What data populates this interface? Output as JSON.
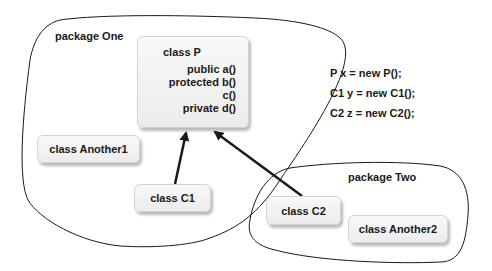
{
  "diagram": {
    "packages": [
      {
        "id": "one",
        "label": "package One"
      },
      {
        "id": "two",
        "label": "package Two"
      }
    ],
    "classes": {
      "P": {
        "title": "class P",
        "methods": [
          "public a()",
          "protected b()",
          "c()",
          "private d()"
        ]
      },
      "Another1": {
        "title": "class Another1"
      },
      "C1": {
        "title": "class C1"
      },
      "C2": {
        "title": "class C2"
      },
      "Another2": {
        "title": "class Another2"
      }
    },
    "edges": [
      {
        "from": "C1",
        "to": "P",
        "type": "inheritance-arrow"
      },
      {
        "from": "C2",
        "to": "P",
        "type": "inheritance-arrow"
      }
    ],
    "code_lines": [
      "P x = new P();",
      "C1 y = new C1();",
      "C2 z = new C2();"
    ],
    "colors": {
      "line": "#1a1a1a",
      "box_fill": "#f2f2f2",
      "box_border": "#d4d4d4",
      "background": "#ffffff"
    }
  }
}
